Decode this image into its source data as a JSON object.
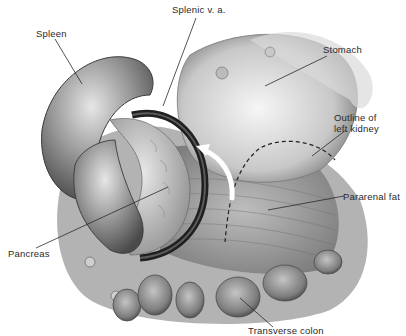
{
  "figure": {
    "type": "anatomical-illustration",
    "colors": {
      "ink": "#2a2a2a",
      "shade_dark": "#3a3a3a",
      "shade_mid": "#8a8a8a",
      "shade_light": "#cfcfcf",
      "background": "#ffffff"
    }
  },
  "labels": {
    "spleen": "Spleen",
    "splenic_va": "Splenic v. a.",
    "stomach": "Stomach",
    "kidney_line1": "Outline of",
    "kidney_line2": "left kidney",
    "pararenal_fat": "Pararenal fat",
    "pancreas": "Pancreas",
    "transverse_colon": "Transverse colon"
  }
}
